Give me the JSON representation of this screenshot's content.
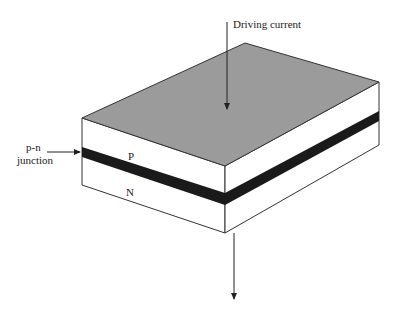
{
  "diagram": {
    "labels": {
      "driving_current": "Driving current",
      "pn_junction_line1": "p-n",
      "pn_junction_line2": "junction",
      "p_layer": "P",
      "n_layer": "N"
    },
    "colors": {
      "top_face": "#9b9b9b",
      "junction": "#1a1a1a",
      "face": "#ffffff",
      "stroke": "#333333"
    }
  }
}
